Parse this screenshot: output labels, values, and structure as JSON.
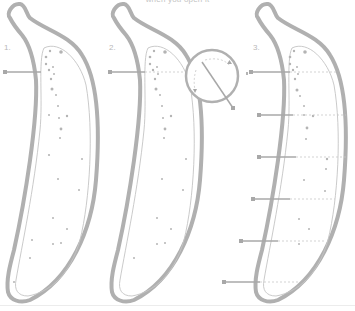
{
  "diagram": {
    "caption": "when you open it",
    "steps": [
      {
        "label": "1.",
        "x": 4,
        "y": 47
      },
      {
        "label": "2.",
        "x": 109,
        "y": 47
      },
      {
        "label": "3.",
        "x": 253,
        "y": 47
      }
    ],
    "colors": {
      "outline": "#b0b0b0",
      "thin_line": "#c2c2c2",
      "dot": "#b4b4b4",
      "pointer": "#a8a8a8",
      "dashed": "#c8c8c8",
      "background": "#ffffff"
    },
    "bananas": [
      {
        "name": "banana-1",
        "offset_x": 0
      },
      {
        "name": "banana-2",
        "offset_x": 104
      },
      {
        "name": "banana-3",
        "offset_x": 248
      }
    ],
    "magnifier": {
      "cx": 212,
      "cy": 76,
      "r": 26
    }
  }
}
